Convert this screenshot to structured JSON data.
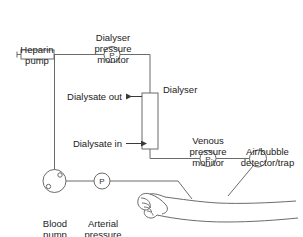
{
  "diagram": {
    "colors": {
      "line": "#6b6b6b",
      "line_dark": "#3a3a3a",
      "text": "#222222",
      "background": "#ffffff"
    },
    "labels": {
      "heparin_pump": "Heparin\npump",
      "dialyser_pressure_monitor": "Dialyser\npressure\nmonitor",
      "dialyser": "Dialyser",
      "dialysate_out": "Dialysate out",
      "dialysate_in": "Dialysate in",
      "venous_pressure_monitor": "Venous\npressure\nmonitor",
      "air_bubble_detector": "Air/bubble\ndetector/trap",
      "blood_pump": "Blood\npump",
      "arterial_pressure_monitor": "Arterial\npressure\nmonitor"
    },
    "monitor_glyph": "P",
    "components": [
      {
        "name": "heparin-pump",
        "shape": "syringe",
        "label_key": "heparin_pump"
      },
      {
        "name": "dialyser-pressure-monitor",
        "shape": "circle-p",
        "label_key": "dialyser_pressure_monitor"
      },
      {
        "name": "dialyser",
        "shape": "rectangle",
        "label_key": "dialyser"
      },
      {
        "name": "venous-pressure-monitor",
        "shape": "circle-p",
        "label_key": "venous_pressure_monitor"
      },
      {
        "name": "air-bubble-detector",
        "shape": "circle",
        "label_key": "air_bubble_detector"
      },
      {
        "name": "blood-pump",
        "shape": "roller-pump",
        "label_key": "blood_pump"
      },
      {
        "name": "arterial-pressure-monitor",
        "shape": "circle-p",
        "label_key": "arterial_pressure_monitor"
      },
      {
        "name": "patient-arm",
        "shape": "arm-with-hand",
        "label_key": null
      }
    ]
  }
}
